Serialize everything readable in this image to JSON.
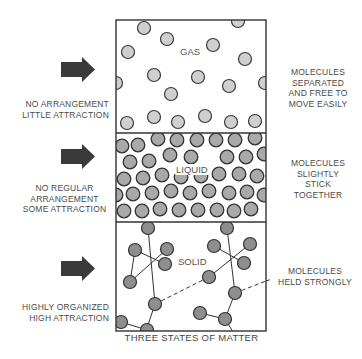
{
  "title": "THREE STATES OF MATTER",
  "colors": {
    "outline": "#333333",
    "gas_molecule": "#cfcfcf",
    "liquid_molecule": "#a9a9a9",
    "solid_molecule": "#8e8e8e",
    "arrow": "#3a3a3a",
    "text": "#4a4a4a"
  },
  "states": [
    {
      "name": "GAS",
      "left_label": [
        "NO ARRANGEMENT",
        "LITTLE ATTRACTION"
      ],
      "right_label": [
        "MOLECULES",
        "SEPARATED",
        "AND FREE TO",
        "MOVE EASILY"
      ],
      "arrow_icon": "right-arrow-icon"
    },
    {
      "name": "LIQUID",
      "left_label": [
        "NO REGULAR",
        "ARRANGEMENT",
        "SOME ATTRACTION"
      ],
      "right_label": [
        "MOLECULES",
        "SLIGHTLY",
        "STICK",
        "TOGETHER"
      ],
      "arrow_icon": "right-arrow-icon"
    },
    {
      "name": "SOLID",
      "left_label": [
        "HIGHLY ORGANIZED",
        "HIGH ATTRACTION"
      ],
      "right_label": [
        "MOLECULES",
        "HELD STRONGLY"
      ],
      "arrow_icon": "right-arrow-icon"
    }
  ]
}
